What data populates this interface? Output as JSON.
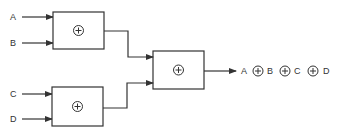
{
  "diagram": {
    "type": "xor-tree",
    "inputs": [
      {
        "label": "A",
        "x": 13,
        "y": 20
      },
      {
        "label": "B",
        "x": 13,
        "y": 46
      },
      {
        "label": "C",
        "x": 13,
        "y": 97
      },
      {
        "label": "D",
        "x": 13,
        "y": 122
      }
    ],
    "gates": [
      {
        "id": "gate-1",
        "x": 53,
        "y": 12,
        "w": 51,
        "h": 37,
        "operator": "xor"
      },
      {
        "id": "gate-2",
        "x": 52,
        "y": 87,
        "w": 51,
        "h": 39,
        "operator": "xor"
      },
      {
        "id": "gate-3",
        "x": 153,
        "y": 51,
        "w": 51,
        "h": 38,
        "operator": "xor"
      }
    ],
    "output": {
      "terms": [
        "A",
        "B",
        "C",
        "D"
      ],
      "operator_symbol": "⊕"
    },
    "colors": {
      "stroke": "#333333",
      "background": "#ffffff"
    }
  }
}
